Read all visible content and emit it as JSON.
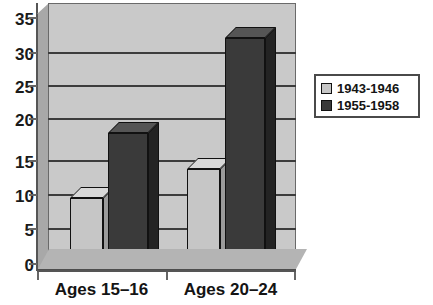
{
  "chart_data": {
    "type": "bar",
    "title": "",
    "xlabel": "",
    "ylabel": "",
    "categories": [
      "Ages 15–16",
      "Ages 20–24"
    ],
    "series": [
      {
        "name": "1943-1946",
        "values": [
          10,
          14
        ],
        "color": "#c6c6c6"
      },
      {
        "name": "1955-1958",
        "values": [
          19,
          32
        ],
        "color": "#3a3a3a"
      }
    ],
    "ylim": [
      0,
      35
    ],
    "yticks": [
      0,
      5,
      10,
      15,
      20,
      25,
      30,
      35
    ],
    "ytick_labels": [
      "0",
      "5",
      "10",
      "15",
      "20",
      "25",
      "30",
      "35"
    ],
    "grid": true,
    "legend_position": "right",
    "style": "3d-column"
  },
  "legend": {
    "items": [
      {
        "label": "1943-1946",
        "swatch": "light-gray-swatch"
      },
      {
        "label": "1955-1958",
        "swatch": "dark-gray-swatch"
      }
    ]
  },
  "axes": {
    "y_ticks": [
      "35",
      "30",
      "25",
      "20",
      "15",
      "10",
      "5",
      "0"
    ],
    "x_categories": [
      "Ages 15–16",
      "Ages 20–24"
    ]
  }
}
